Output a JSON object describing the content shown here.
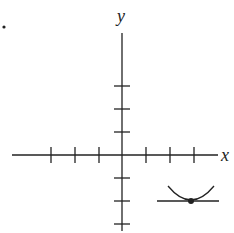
{
  "diagram": {
    "bullet": "•",
    "axes": {
      "x_label": "x",
      "y_label": "y",
      "x_ticks": [
        -3,
        -2,
        -1,
        1,
        2,
        3
      ],
      "y_ticks": [
        3,
        2,
        1,
        -1,
        -2,
        -3
      ]
    },
    "tangent_point": {
      "x": 3,
      "y": -2
    },
    "annotation": "Horizontal tangent line at a local minimum of a curve",
    "colors": {
      "ink": "#222222",
      "background": "#ffffff"
    }
  }
}
